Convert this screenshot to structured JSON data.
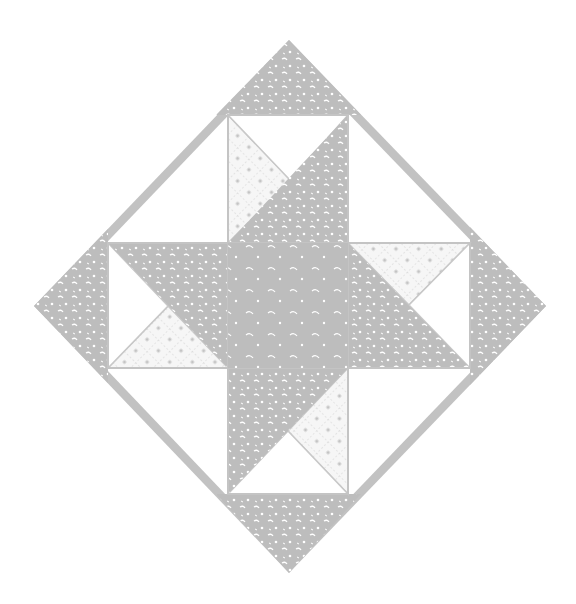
{
  "figure": {
    "pattern": "variable star in diamond (on-point) setting",
    "colors": {
      "background": "#ffffff",
      "fabric_gray": "#bdbdbd",
      "print_light": "#f4f4f4",
      "print_mark": "#c4c4c4",
      "border": "#c2c2c2"
    },
    "outer_diamond": {
      "top": [
        289,
        40
      ],
      "right": [
        546,
        306
      ],
      "bottom": [
        289,
        573
      ],
      "left": [
        34,
        306
      ]
    },
    "inner_block": {
      "x0": 108,
      "x1": 470,
      "y0": 115,
      "y1": 494,
      "cx": 288,
      "cy": 306
    },
    "center_square": {
      "x0": 228,
      "x1": 348,
      "y0": 243,
      "y1": 368
    },
    "elements": [
      {
        "name": "top-cap",
        "fabric": "gray-print"
      },
      {
        "name": "bottom-cap",
        "fabric": "gray-print"
      },
      {
        "name": "left-cap",
        "fabric": "gray-print"
      },
      {
        "name": "right-cap",
        "fabric": "gray-print"
      },
      {
        "name": "center-square",
        "fabric": "gray-solid"
      },
      {
        "name": "star-points",
        "count": 4,
        "fabric": "gray-print"
      },
      {
        "name": "crosshatch-triangles",
        "count": 4,
        "fabric": "light-print"
      },
      {
        "name": "white-triangles",
        "count": 4,
        "fabric": "white"
      },
      {
        "name": "corner-gaps",
        "count": 4,
        "fabric": "white"
      }
    ]
  }
}
